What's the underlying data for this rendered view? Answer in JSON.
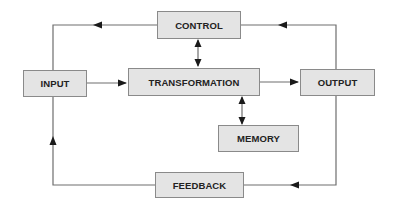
{
  "diagram": {
    "nodes": {
      "control": {
        "label": "CONTROL"
      },
      "input": {
        "label": "INPUT"
      },
      "transformation": {
        "label": "TRANSFORMATION"
      },
      "output": {
        "label": "OUTPUT"
      },
      "memory": {
        "label": "MEMORY"
      },
      "feedback": {
        "label": "FEEDBACK"
      }
    },
    "edges": [
      {
        "from": "input",
        "to": "transformation",
        "type": "arrow"
      },
      {
        "from": "transformation",
        "to": "output",
        "type": "arrow"
      },
      {
        "from": "control",
        "to": "transformation",
        "type": "bidirectional"
      },
      {
        "from": "transformation",
        "to": "memory",
        "type": "bidirectional"
      },
      {
        "from": "output",
        "to": "control",
        "type": "arrow"
      },
      {
        "from": "control",
        "to": "input",
        "type": "arrow"
      },
      {
        "from": "output",
        "to": "feedback",
        "type": "arrow"
      },
      {
        "from": "feedback",
        "to": "input",
        "type": "arrow"
      }
    ],
    "colors": {
      "box_fill": "#e4e4e4",
      "box_border": "#8a8a8a",
      "line": "#6e6e6e",
      "arrowhead": "#1a1a1a",
      "text": "#222222"
    }
  }
}
